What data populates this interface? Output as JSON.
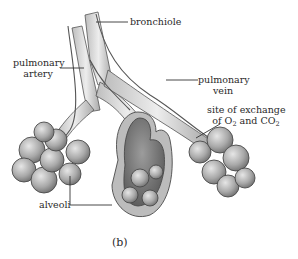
{
  "figure": {
    "caption": "(b)"
  },
  "labels": {
    "bronchiole": "bronchiole",
    "pulmonary_artery_line1": "pulmonary",
    "pulmonary_artery_line2": "artery",
    "pulmonary_vein_line1": "pulmonary",
    "pulmonary_vein_line2": "vein",
    "exchange_line1": "site of exchange",
    "exchange_line2_prefix": "of O",
    "exchange_line2_sub1": "2",
    "exchange_line2_mid": " and CO",
    "exchange_line2_sub2": "2",
    "alveoli": "alveoli"
  },
  "colors": {
    "tissue_light": "#d9d9d9",
    "tissue_mid": "#a8a8a8",
    "tissue_dark": "#6e6e6e",
    "outline": "#4a4a4a",
    "leader_line": "#333333"
  }
}
